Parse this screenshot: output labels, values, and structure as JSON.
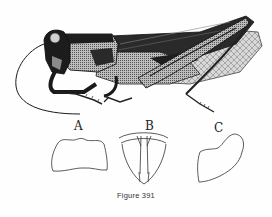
{
  "figure": {
    "caption": "Figure 391",
    "panels": [
      {
        "label": "A",
        "subject": "pronotum-dorsal-outline"
      },
      {
        "label": "B",
        "subject": "sternum-plate-outline"
      },
      {
        "label": "C",
        "subject": "lateral-lobe-outline"
      }
    ]
  },
  "colors": {
    "ink": "#1a1a1a",
    "shade": "#555555",
    "light": "#9a9a9a",
    "paper": "#fefefe"
  }
}
